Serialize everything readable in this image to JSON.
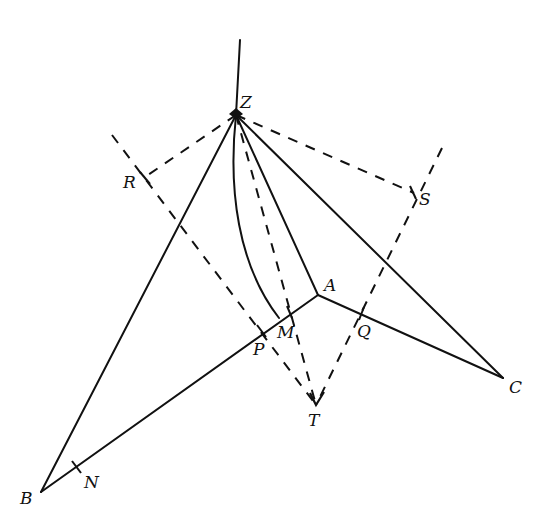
{
  "diagram": {
    "type": "geometric-construction",
    "colors": {
      "stroke": "#111111",
      "background": "#ffffff"
    },
    "points": {
      "Z": {
        "label": "Z",
        "x": 236,
        "y": 115
      },
      "A": {
        "label": "A",
        "x": 318,
        "y": 295
      },
      "B": {
        "label": "B",
        "x": 41,
        "y": 492
      },
      "C": {
        "label": "C",
        "x": 503,
        "y": 378
      },
      "M": {
        "label": "M",
        "x": 283,
        "y": 318
      },
      "P": {
        "label": "P",
        "x": 262,
        "y": 331
      },
      "Q": {
        "label": "Q",
        "x": 361,
        "y": 314
      },
      "N": {
        "label": "N",
        "x": 77,
        "y": 467
      },
      "T": {
        "label": "T",
        "x": 316,
        "y": 405
      },
      "R": {
        "label": "R",
        "x": 145,
        "y": 177
      },
      "S": {
        "label": "S",
        "x": 414,
        "y": 193
      }
    },
    "labels": {
      "Z": "Z",
      "A": "A",
      "B": "B",
      "C": "C",
      "M": "M",
      "P": "P",
      "Q": "Q",
      "N": "N",
      "T": "T",
      "R": "R",
      "S": "S"
    },
    "solid_segments": [
      "Z-top",
      "Z-A",
      "Z-B",
      "Z-C",
      "B-A",
      "A-C",
      "arc Z-M"
    ],
    "dashed_segments": [
      "Z-R",
      "Z-S",
      "Z-T",
      "R-T (through P)",
      "S-T (through Q)"
    ]
  }
}
